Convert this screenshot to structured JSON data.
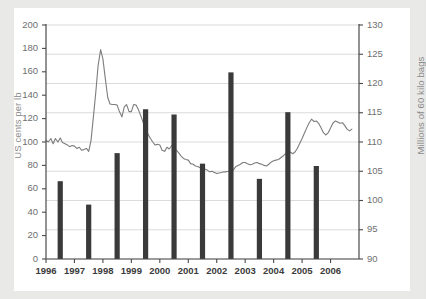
{
  "figure": {
    "background_color": "#e9e9e7",
    "panel_color": "#ffffff",
    "bar_color": "#3a3a3a",
    "line_color": "#7d7d7d",
    "grid_color": "#d7d7d7",
    "axis_color": "#4a4a4a"
  },
  "chart_data": {
    "type": "bar",
    "title": "",
    "subtitle": "",
    "xlabel": "",
    "ylabel": "US cents per lb",
    "ylabel_secondary": "Millions of 60 kilo bags",
    "grid": true,
    "legend": "none",
    "xlim": [
      1996,
      2007
    ],
    "ylim": [
      0,
      200
    ],
    "ylim_secondary": [
      90,
      130
    ],
    "yticks": [
      0,
      20,
      40,
      60,
      80,
      100,
      120,
      140,
      160,
      180,
      200
    ],
    "yticks_secondary": [
      90,
      95,
      100,
      105,
      110,
      115,
      120,
      125,
      130
    ],
    "xticks": [
      1996,
      1997,
      1998,
      1999,
      2000,
      2001,
      2002,
      2003,
      2004,
      2005,
      2006
    ],
    "categories": [
      "1996",
      "1997",
      "1998",
      "1999",
      "2000",
      "2001",
      "2002",
      "2003",
      "2004",
      "2005",
      "2006"
    ],
    "values": [
      66.5,
      46.5,
      90.5,
      128.0,
      123.5,
      81.5,
      159.5,
      68.5,
      125.5,
      79.5,
      null
    ],
    "series": [
      {
        "name": "US cents per lb",
        "type": "bar",
        "axis": "left",
        "x": [
          1996.5,
          1997.5,
          1998.5,
          1999.5,
          2000.5,
          2001.5,
          2002.5,
          2003.5,
          2004.5,
          2005.5
        ],
        "values": [
          66.5,
          46.5,
          90.5,
          128.0,
          123.5,
          81.5,
          159.5,
          68.5,
          125.5,
          79.5
        ]
      },
      {
        "name": "Millions of 60 kilo bags",
        "type": "line",
        "axis": "right",
        "x": [
          1996.0,
          1996.08,
          1996.17,
          1996.25,
          1996.33,
          1996.42,
          1996.5,
          1996.58,
          1996.67,
          1996.75,
          1996.83,
          1996.92,
          1997.0,
          1997.08,
          1997.17,
          1997.25,
          1997.33,
          1997.42,
          1997.5,
          1997.58,
          1997.67,
          1997.75,
          1997.83,
          1997.92,
          1998.0,
          1998.08,
          1998.17,
          1998.25,
          1998.33,
          1998.42,
          1998.5,
          1998.58,
          1998.67,
          1998.75,
          1998.83,
          1998.92,
          1999.0,
          1999.08,
          1999.17,
          1999.25,
          1999.33,
          1999.42,
          1999.5,
          1999.58,
          1999.67,
          1999.75,
          1999.83,
          1999.92,
          2000.0,
          2000.08,
          2000.17,
          2000.25,
          2000.33,
          2000.42,
          2000.5,
          2000.58,
          2000.67,
          2000.75,
          2000.83,
          2000.92,
          2001.0,
          2001.08,
          2001.17,
          2001.25,
          2001.33,
          2001.42,
          2001.5,
          2001.58,
          2001.67,
          2001.75,
          2001.83,
          2001.92,
          2002.0,
          2002.08,
          2002.17,
          2002.25,
          2002.33,
          2002.42,
          2002.5,
          2002.58,
          2002.67,
          2002.75,
          2002.83,
          2002.92,
          2003.0,
          2003.08,
          2003.17,
          2003.25,
          2003.33,
          2003.42,
          2003.5,
          2003.58,
          2003.67,
          2003.75,
          2003.83,
          2003.92,
          2004.0,
          2004.08,
          2004.17,
          2004.25,
          2004.33,
          2004.42,
          2004.5,
          2004.58,
          2004.67,
          2004.75,
          2004.83,
          2004.92,
          2005.0,
          2005.08,
          2005.17,
          2005.25,
          2005.33,
          2005.42,
          2005.5,
          2005.58,
          2005.67,
          2005.75,
          2005.83,
          2005.92,
          2006.0,
          2006.08,
          2006.17,
          2006.25,
          2006.33,
          2006.42,
          2006.5,
          2006.58,
          2006.67,
          2006.75
        ],
        "values": [
          110.3,
          110.0,
          110.6,
          109.7,
          110.6,
          110.0,
          110.7,
          109.9,
          109.7,
          109.5,
          109.2,
          109.4,
          109.3,
          108.9,
          109.1,
          108.6,
          108.7,
          108.9,
          108.4,
          110.2,
          114.5,
          118.5,
          123.0,
          125.8,
          124.2,
          121.0,
          117.6,
          116.5,
          116.4,
          116.4,
          116.3,
          115.2,
          114.3,
          116.0,
          116.4,
          115.2,
          115.2,
          116.4,
          116.3,
          115.5,
          114.5,
          113.3,
          112.4,
          111.4,
          110.6,
          110.0,
          109.5,
          109.6,
          109.5,
          108.6,
          108.4,
          109.1,
          108.8,
          109.4,
          108.9,
          108.6,
          108.1,
          107.6,
          107.2,
          107.0,
          106.9,
          106.3,
          106.2,
          105.9,
          105.8,
          105.6,
          105.6,
          105.4,
          105.2,
          104.9,
          105.0,
          104.8,
          104.6,
          104.7,
          104.8,
          104.9,
          104.9,
          105.0,
          105.1,
          105.2,
          105.8,
          106.0,
          106.2,
          106.5,
          106.5,
          106.3,
          106.1,
          106.2,
          106.4,
          106.5,
          106.3,
          106.2,
          106.0,
          105.9,
          106.2,
          106.6,
          106.8,
          106.9,
          107.0,
          107.3,
          107.6,
          108.0,
          108.2,
          108.3,
          108.0,
          108.3,
          108.9,
          109.8,
          110.6,
          111.5,
          112.5,
          113.3,
          113.9,
          113.5,
          113.6,
          113.2,
          112.4,
          111.6,
          111.2,
          111.6,
          112.4,
          113.2,
          113.6,
          113.4,
          113.2,
          113.3,
          112.8,
          112.2,
          111.9,
          112.2
        ]
      }
    ]
  },
  "axes": {
    "left_title": "US cents per lb",
    "right_title": "Millions of 60 kilo bags",
    "left_ticks": [
      "200",
      "180",
      "160",
      "140",
      "120",
      "100",
      "80",
      "60",
      "40",
      "20",
      "0"
    ],
    "right_ticks": [
      "130",
      "125",
      "120",
      "115",
      "110",
      "105",
      "100",
      "95",
      "90"
    ],
    "x_ticks": [
      "1996",
      "1997",
      "1998",
      "1999",
      "2000",
      "2001",
      "2002",
      "2003",
      "2004",
      "2005",
      "2006"
    ]
  }
}
